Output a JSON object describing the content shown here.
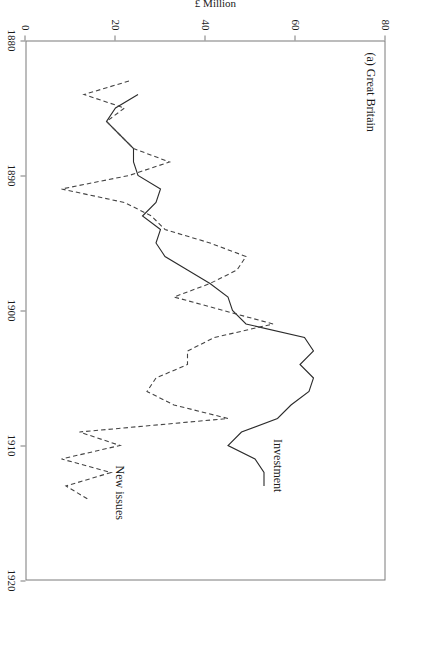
{
  "figure": {
    "panel_title": "(a) Great Britain"
  },
  "chart_data": {
    "type": "line",
    "title": "(a) Great Britain",
    "xlabel": "",
    "ylabel": "£ Million",
    "xlim": [
      1880,
      1920
    ],
    "ylim": [
      0,
      80
    ],
    "xticks": [
      1880,
      1890,
      1900,
      1910,
      1920
    ],
    "xticklabels": [
      "1880",
      "1890",
      "1900",
      "1910",
      "1920"
    ],
    "yticks": [
      0,
      20,
      40,
      60,
      80
    ],
    "yticklabels": [
      "0",
      "20",
      "40",
      "60",
      "80"
    ],
    "grid": false,
    "orientation": "rotated-90-clockwise",
    "legend": "inline-labels",
    "series": [
      {
        "name": "Investment",
        "style": "solid",
        "color": "#2b2b2b",
        "label_x": 1911.5,
        "label_y": 56,
        "x": [
          1884,
          1885,
          1886,
          1887,
          1888,
          1889,
          1890,
          1891,
          1892,
          1893,
          1894,
          1895,
          1896,
          1897,
          1898,
          1899,
          1900,
          1901,
          1902,
          1903,
          1904,
          1905,
          1906,
          1907,
          1908,
          1909,
          1910,
          1911,
          1912,
          1913
        ],
        "y": [
          25,
          20,
          18,
          21,
          24,
          24,
          25,
          30,
          29,
          26,
          30,
          29,
          31,
          36,
          41,
          45,
          46,
          49,
          62,
          64,
          61,
          64,
          63,
          59,
          56,
          48,
          45,
          51,
          53,
          53
        ]
      },
      {
        "name": "New issues",
        "style": "dashed",
        "color": "#444444",
        "label_x": 1913.5,
        "label_y": 21,
        "x": [
          1883,
          1884,
          1885,
          1886,
          1887,
          1888,
          1889,
          1890,
          1891,
          1892,
          1893,
          1894,
          1895,
          1896,
          1897,
          1898,
          1899,
          1900,
          1901,
          1902,
          1903,
          1904,
          1905,
          1906,
          1907,
          1908,
          1909,
          1910,
          1911,
          1912,
          1913,
          1914
        ],
        "y": [
          23,
          13,
          22,
          18,
          21,
          24,
          32,
          23,
          8,
          22,
          28,
          31,
          41,
          49,
          47,
          41,
          33,
          44,
          55,
          42,
          36,
          36,
          29,
          27,
          33,
          45,
          12,
          21,
          8,
          19,
          9,
          14
        ]
      }
    ]
  },
  "axes": {
    "x_tick_labels": [
      "1880",
      "1890",
      "1900",
      "1910",
      "1920"
    ],
    "y_tick_labels": [
      "0",
      "20",
      "40",
      "60",
      "80"
    ],
    "y_axis_title": "£ Million"
  },
  "labels": {
    "investment": "Investment",
    "new_issues": "New issues"
  }
}
